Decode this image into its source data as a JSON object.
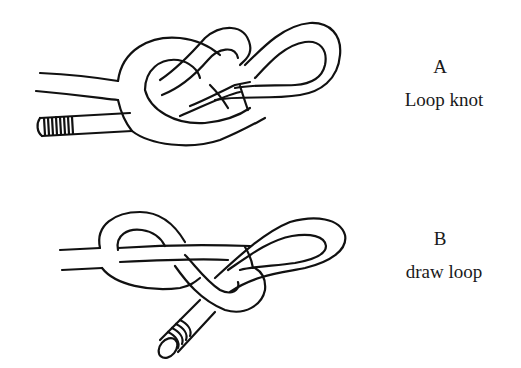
{
  "figures": [
    {
      "id": "A",
      "letter": "A",
      "caption": "Loop knot"
    },
    {
      "id": "B",
      "letter": "B",
      "caption": "draw loop"
    }
  ],
  "colors": {
    "line": "#111111",
    "background": "#ffffff",
    "text": "#1a1a1a"
  }
}
